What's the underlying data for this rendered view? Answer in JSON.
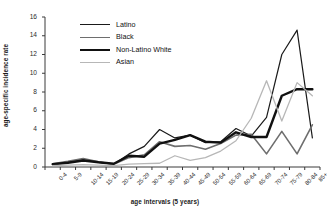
{
  "chart_data": {
    "type": "line",
    "title": "",
    "xlabel": "age intervals (5 years)",
    "ylabel": "age-specific incidence rate",
    "categories": [
      "0-4",
      "5-9",
      "10-14",
      "15-19",
      "20-24",
      "25-29",
      "30-34",
      "35-39",
      "40-44",
      "45-49",
      "50-54",
      "55-59",
      "60-64",
      "65-69",
      "70-74",
      "75-79",
      "80-84",
      "85+"
    ],
    "ylim": [
      0,
      16
    ],
    "yticks": [
      0,
      2,
      4,
      6,
      8,
      10,
      12,
      14,
      16
    ],
    "grid": false,
    "legend_position": "upper-left-inside",
    "series": [
      {
        "name": "Latino",
        "color": "#1a1a1a",
        "width": 1.2,
        "values": [
          0.3,
          0.5,
          0.8,
          0.5,
          0.3,
          1.4,
          2.2,
          4.0,
          3.1,
          3.4,
          2.6,
          2.7,
          4.1,
          3.3,
          5.3,
          12.0,
          14.6,
          3.1
        ]
      },
      {
        "name": "Black",
        "color": "#6e6e6e",
        "width": 1.6,
        "values": [
          0.35,
          0.6,
          0.9,
          0.55,
          0.3,
          1.0,
          1.3,
          2.7,
          2.2,
          2.3,
          1.9,
          2.5,
          3.4,
          3.5,
          1.4,
          3.8,
          1.4,
          4.5
        ]
      },
      {
        "name": "Non-Latino White",
        "color": "#111111",
        "width": 2.4,
        "values": [
          0.3,
          0.45,
          0.7,
          0.5,
          0.35,
          1.2,
          1.1,
          2.5,
          2.9,
          3.4,
          2.7,
          2.6,
          3.7,
          3.2,
          3.2,
          7.6,
          8.3,
          8.3
        ]
      },
      {
        "name": "Asian",
        "color": "#b7b7b7",
        "width": 1.3,
        "values": [
          0.15,
          0.2,
          0.25,
          0.2,
          0.15,
          0.3,
          0.35,
          0.4,
          1.2,
          0.7,
          1.0,
          1.7,
          2.8,
          5.2,
          9.2,
          4.9,
          9.0,
          7.6
        ]
      }
    ]
  },
  "legend": {
    "items": [
      {
        "label": "Latino"
      },
      {
        "label": "Black"
      },
      {
        "label": "Non-Latino White"
      },
      {
        "label": "Asian"
      }
    ]
  }
}
